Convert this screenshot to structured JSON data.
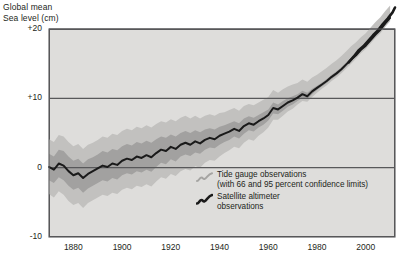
{
  "axis_title": "Global mean\nSea level (cm)",
  "y_ticks": [
    {
      "label": "+20",
      "value": 20
    },
    {
      "label": "+10",
      "value": 10
    },
    {
      "label": "0",
      "value": 0
    },
    {
      "label": "-10",
      "value": -10
    }
  ],
  "x_ticks": [
    {
      "label": "1880",
      "value": 1880
    },
    {
      "label": "1900",
      "value": 1900
    },
    {
      "label": "1920",
      "value": 1920
    },
    {
      "label": "1940",
      "value": 1940
    },
    {
      "label": "1960",
      "value": 1960
    },
    {
      "label": "1980",
      "value": 1980
    },
    {
      "label": "2000",
      "value": 2000
    }
  ],
  "legend": {
    "tide_gauge_label": "Tide gauge observations\n(with 66 and 95 percent confidence limits)",
    "tide_gauge_swatch": "gray-wiggle-line-icon",
    "satellite_label": "Satellite altimeter\nobservations",
    "satellite_swatch": "black-wiggle-line-icon"
  },
  "colors": {
    "plot_background": "#dedddb",
    "plot_border": "#58585a",
    "gridline": "#58585a",
    "band_95": "#c2c1bf",
    "band_66": "#a2a1a0",
    "series_line": "#1a1a1a",
    "text": "#231f20"
  },
  "chart_data": {
    "type": "line",
    "title": "Global mean Sea level (cm)",
    "xlabel": "",
    "ylabel": "Global mean Sea level (cm)",
    "xlim": [
      1870,
      2012
    ],
    "ylim": [
      -10,
      20
    ],
    "grid": true,
    "gridlines_y": [
      0,
      10,
      20
    ],
    "legend_position": "inside-bottom-right",
    "series": [
      {
        "name": "Tide gauge observations",
        "style": "line-with-confidence-bands",
        "x": [
          1870,
          1872,
          1874,
          1876,
          1878,
          1880,
          1882,
          1884,
          1886,
          1888,
          1890,
          1892,
          1894,
          1896,
          1898,
          1900,
          1902,
          1904,
          1906,
          1908,
          1910,
          1912,
          1914,
          1916,
          1918,
          1920,
          1922,
          1924,
          1926,
          1928,
          1930,
          1932,
          1934,
          1936,
          1938,
          1940,
          1942,
          1944,
          1946,
          1948,
          1950,
          1952,
          1954,
          1956,
          1958,
          1960,
          1962,
          1964,
          1966,
          1968,
          1970,
          1972,
          1974,
          1976,
          1978,
          1980,
          1982,
          1984,
          1986,
          1988,
          1990,
          1992,
          1994,
          1996,
          1998,
          2000,
          2002,
          2004,
          2006,
          2008,
          2010
        ],
        "values": [
          0.1,
          -0.3,
          0.6,
          0.3,
          -0.5,
          -1.1,
          -0.8,
          -1.5,
          -0.9,
          -0.5,
          -0.1,
          0.3,
          0.1,
          0.6,
          0.4,
          1.0,
          1.3,
          1.1,
          1.6,
          1.4,
          1.8,
          1.5,
          2.1,
          2.6,
          2.4,
          3.0,
          2.7,
          3.3,
          3.6,
          3.3,
          3.8,
          3.5,
          4.0,
          4.3,
          4.1,
          4.6,
          4.9,
          5.2,
          5.6,
          5.3,
          6.0,
          6.4,
          6.2,
          6.7,
          7.1,
          7.6,
          8.6,
          8.4,
          8.9,
          9.4,
          9.7,
          10.1,
          10.6,
          10.3,
          11.0,
          11.5,
          12.0,
          12.5,
          13.1,
          13.6,
          14.2,
          14.9,
          15.6,
          16.2,
          17.0,
          17.6,
          18.4,
          19.2,
          19.9,
          20.8,
          21.6
        ],
        "band_66_lower": [
          -1.8,
          -2.2,
          -1.4,
          -1.8,
          -2.6,
          -3.2,
          -2.9,
          -3.6,
          -3.0,
          -2.6,
          -2.2,
          -1.8,
          -2.0,
          -1.5,
          -1.7,
          -1.1,
          -0.8,
          -1.0,
          -0.5,
          -0.7,
          -0.3,
          -0.6,
          0.1,
          0.7,
          0.5,
          1.2,
          0.9,
          1.6,
          1.9,
          1.7,
          2.2,
          2.0,
          2.6,
          2.9,
          2.8,
          3.3,
          3.7,
          4.0,
          4.5,
          4.2,
          4.9,
          5.4,
          5.2,
          5.8,
          6.2,
          6.8,
          7.8,
          7.7,
          8.2,
          8.8,
          9.1,
          9.6,
          10.1,
          9.9,
          10.6,
          11.2,
          11.7,
          12.2,
          12.8,
          13.3,
          13.9,
          14.6,
          15.3,
          16.0,
          16.8,
          17.4,
          18.2,
          19.0,
          19.7,
          20.6,
          21.4
        ],
        "band_66_upper": [
          2.0,
          1.6,
          2.6,
          2.4,
          1.6,
          1.0,
          1.3,
          0.6,
          1.2,
          1.5,
          1.9,
          2.4,
          2.2,
          2.7,
          2.5,
          3.1,
          3.4,
          3.2,
          3.7,
          3.5,
          3.9,
          3.6,
          4.1,
          4.5,
          4.3,
          4.8,
          4.5,
          5.0,
          5.3,
          5.0,
          5.4,
          5.1,
          5.5,
          5.7,
          5.5,
          5.9,
          6.1,
          6.4,
          6.7,
          6.4,
          7.1,
          7.4,
          7.2,
          7.6,
          8.0,
          8.4,
          9.4,
          9.1,
          9.6,
          10.0,
          10.3,
          10.6,
          11.1,
          10.8,
          11.4,
          11.8,
          12.3,
          12.8,
          13.4,
          13.9,
          14.5,
          15.2,
          15.9,
          16.5,
          17.2,
          17.8,
          18.6,
          19.4,
          20.1,
          21.0,
          21.8
        ],
        "band_95_lower": [
          -3.8,
          -4.3,
          -3.4,
          -3.9,
          -4.8,
          -5.4,
          -5.1,
          -5.8,
          -5.1,
          -4.7,
          -4.3,
          -3.9,
          -4.1,
          -3.6,
          -3.8,
          -3.2,
          -2.9,
          -3.1,
          -2.6,
          -2.8,
          -2.4,
          -2.7,
          -2.0,
          -1.4,
          -1.6,
          -0.9,
          -1.2,
          -0.5,
          -0.2,
          -0.4,
          0.2,
          0.0,
          0.7,
          1.1,
          1.0,
          1.6,
          2.1,
          2.5,
          3.0,
          2.8,
          3.6,
          4.1,
          3.9,
          4.6,
          5.1,
          5.8,
          6.9,
          6.9,
          7.5,
          8.1,
          8.5,
          9.1,
          9.6,
          9.5,
          10.2,
          10.8,
          11.4,
          11.9,
          12.5,
          13.0,
          13.6,
          14.3,
          15.0,
          15.7,
          16.5,
          17.1,
          17.9,
          18.7,
          19.4,
          20.3,
          21.1
        ],
        "band_95_upper": [
          4.1,
          3.7,
          4.7,
          4.5,
          3.7,
          3.1,
          3.4,
          2.7,
          3.3,
          3.6,
          4.0,
          4.5,
          4.3,
          4.9,
          4.7,
          5.3,
          5.6,
          5.4,
          5.9,
          5.7,
          6.1,
          5.8,
          6.3,
          6.7,
          6.5,
          7.0,
          6.7,
          7.2,
          7.5,
          7.1,
          7.5,
          7.1,
          7.5,
          7.7,
          7.5,
          7.9,
          8.0,
          8.3,
          8.6,
          8.2,
          8.9,
          9.2,
          9.0,
          9.4,
          9.8,
          10.2,
          11.2,
          10.8,
          11.3,
          11.7,
          12.0,
          12.2,
          12.7,
          12.4,
          13.0,
          13.4,
          13.9,
          14.4,
          15.0,
          15.5,
          16.1,
          16.8,
          17.5,
          18.1,
          18.8,
          19.4,
          20.2,
          21.0,
          21.7,
          22.6,
          23.4
        ]
      },
      {
        "name": "Satellite altimeter observations",
        "style": "thick-black-line",
        "x": [
          1993,
          1995,
          1997,
          1999,
          2001,
          2003,
          2005,
          2007,
          2009,
          2011,
          2012
        ],
        "values": [
          15.2,
          16.0,
          16.9,
          17.5,
          18.3,
          19.1,
          19.8,
          20.7,
          21.5,
          22.4,
          23.1
        ]
      }
    ]
  }
}
